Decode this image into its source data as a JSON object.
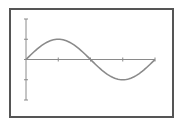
{
  "chart_data": {
    "type": "line",
    "title": "",
    "xlabel": "",
    "ylabel": "",
    "series": [
      {
        "name": "sine",
        "function": "sin(x)",
        "x": [
          0,
          0.7854,
          1.5708,
          2.3562,
          3.1416,
          3.927,
          4.7124,
          5.4978,
          6.2832
        ],
        "values": [
          0,
          0.7071,
          1,
          0.7071,
          0,
          -0.7071,
          -1,
          -0.7071,
          0
        ]
      }
    ],
    "xlim": [
      0,
      6.2832
    ],
    "ylim": [
      -2,
      2
    ],
    "x_ticks": [
      1.5708,
      3.1416,
      4.7124,
      6.2832
    ],
    "y_ticks": [
      2,
      1,
      0,
      -1,
      -2
    ],
    "tick_labels_visible": false,
    "grid": false,
    "legend": null,
    "colors": {
      "curve": "#8a8a8a",
      "axes": "#8a8a8a",
      "frame": "#555555"
    }
  }
}
